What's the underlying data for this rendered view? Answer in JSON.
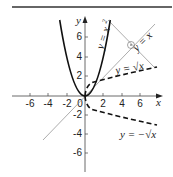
{
  "figure": {
    "title": "",
    "axes": {
      "x_label": "x",
      "y_label": "y",
      "x_ticks": [
        "-6",
        "-4",
        "-2",
        "0",
        "2",
        "4",
        "6"
      ],
      "y_ticks_pos": [
        "2",
        "4",
        "6"
      ],
      "y_ticks_neg": [
        "-2",
        "-4",
        "-6"
      ]
    },
    "curves": {
      "parabola": "y = x²",
      "identity": "y = x",
      "sqrt_pos": "y = √x",
      "sqrt_neg": "y = −√x"
    },
    "colors": {
      "ink": "#222222",
      "thin_line": "#888888",
      "rule": "#333333"
    }
  },
  "labels": {
    "parabola_label": "y = x",
    "parabola_exp": "2",
    "identity_label": "y = x",
    "sqrt_pos_label": "y = √x",
    "sqrt_neg_label": "y = −√x"
  }
}
